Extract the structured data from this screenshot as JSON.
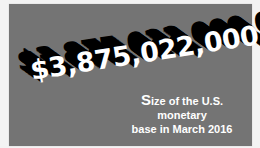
{
  "card": {
    "background_color": "#747474",
    "headline_value": "$3,875,022,000,000",
    "caption": {
      "first_letter": "S",
      "line1_rest": "ize of the U.S. monetary",
      "line2": "base in March 2016"
    }
  }
}
